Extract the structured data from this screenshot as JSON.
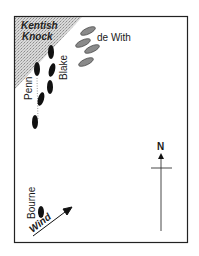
{
  "map": {
    "title": "",
    "shoal": {
      "name_line1": "Kentish",
      "name_line2": "Knock"
    },
    "fleets": [
      {
        "name": "de With",
        "color": "#8a8a8a",
        "ships": [
          [
            95,
            31
          ],
          [
            91,
            41
          ],
          [
            101,
            47
          ],
          [
            90,
            57
          ]
        ]
      },
      {
        "name": "Blake",
        "color": "#111111",
        "ships": [
          [
            52,
            52
          ],
          [
            53,
            70
          ],
          [
            51,
            87
          ]
        ]
      },
      {
        "name": "Penn",
        "color": "#111111",
        "ships": [
          [
            37,
            70
          ],
          [
            41,
            99
          ],
          [
            35,
            122
          ]
        ]
      },
      {
        "name": "Bourne",
        "color": "#111111",
        "ships": [
          [
            41,
            212
          ]
        ]
      }
    ],
    "labels": {
      "de_with": "de With",
      "blake": "Blake",
      "penn": "Penn",
      "bourne": "Bourne",
      "wind": "Wind",
      "north": "N"
    }
  }
}
